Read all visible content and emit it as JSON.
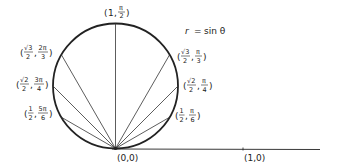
{
  "diagram": {
    "title_equation": "r = sin θ",
    "equation_parts": {
      "lhs": "r",
      "eq": "=",
      "rhs": "sin θ"
    },
    "origin_label": "(0,0)",
    "axis_point_label": "(1,0)",
    "geometry": {
      "center_x": 115.5,
      "origin_y": 148.5,
      "radius": 62.5,
      "axis_end_x": 320
    },
    "colors": {
      "stroke": "#222222",
      "background": "#ffffff"
    },
    "points": [
      {
        "id": "pi-over-2",
        "r_num": "1",
        "r_den": "",
        "r_root": "",
        "theta_num": "π",
        "theta_den": "2",
        "theta_deg": 90
      },
      {
        "id": "pi-over-3",
        "r_num": "√3",
        "r_den": "2",
        "theta_num": "π",
        "theta_den": "3",
        "theta_deg": 60
      },
      {
        "id": "pi-over-4",
        "r_num": "√2",
        "r_den": "2",
        "theta_num": "π",
        "theta_den": "4",
        "theta_deg": 45
      },
      {
        "id": "pi-over-6",
        "r_num": "1",
        "r_den": "2",
        "theta_num": "π",
        "theta_den": "6",
        "theta_deg": 30
      },
      {
        "id": "2pi-over-3",
        "r_num": "√3",
        "r_den": "2",
        "theta_num": "2π",
        "theta_den": "3",
        "theta_deg": 120
      },
      {
        "id": "3pi-over-4",
        "r_num": "√2",
        "r_den": "2",
        "theta_num": "3π",
        "theta_den": "4",
        "theta_deg": 135
      },
      {
        "id": "5pi-over-6",
        "r_num": "1",
        "r_den": "2",
        "theta_num": "5π",
        "theta_den": "6",
        "theta_deg": 150
      }
    ],
    "labels": {
      "top": {
        "r": "1",
        "theta_num": "π",
        "theta_den": "2"
      },
      "right_60": {
        "r_num": "√3",
        "r_den": "2",
        "theta_num": "π",
        "theta_den": "3"
      },
      "right_45": {
        "r_num": "√2",
        "r_den": "2",
        "theta_num": "π",
        "theta_den": "4"
      },
      "right_30": {
        "r_num": "1",
        "r_den": "2",
        "theta_num": "π",
        "theta_den": "6"
      },
      "left_120": {
        "r_num": "√3",
        "r_den": "2",
        "theta_num": "2π",
        "theta_den": "3"
      },
      "left_135": {
        "r_num": "√2",
        "r_den": "2",
        "theta_num": "3π",
        "theta_den": "4"
      },
      "left_150": {
        "r_num": "1",
        "r_den": "2",
        "theta_num": "5π",
        "theta_den": "6"
      }
    },
    "punct": {
      "open": "(",
      "close": ")",
      "comma": ","
    }
  }
}
